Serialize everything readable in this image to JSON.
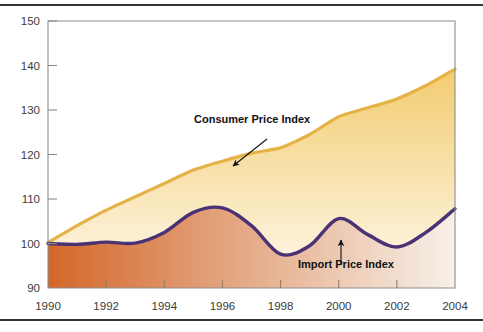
{
  "figure": {
    "name": "price-index-area-chart",
    "background_color": "#ffffff",
    "rule_color": "#333436"
  },
  "chart_data": {
    "type": "area",
    "title": "",
    "subtitle": "",
    "xlabel": "",
    "ylabel": "",
    "xlim": [
      1990,
      2004
    ],
    "ylim": [
      90,
      150
    ],
    "grid": false,
    "legend_position": "inline-annotations",
    "xticks": [
      1990,
      1992,
      1994,
      1996,
      1998,
      2000,
      2002,
      2004
    ],
    "xticklabels": [
      "1990",
      "1992",
      "1994",
      "1996",
      "1998",
      "2000",
      "2002",
      "2004"
    ],
    "yticks": [
      90,
      100,
      110,
      120,
      130,
      140,
      150
    ],
    "yticklabels": [
      "90",
      "100",
      "110",
      "120",
      "130",
      "140",
      "150"
    ],
    "x": [
      1990,
      1991,
      1992,
      1993,
      1994,
      1995,
      1996,
      1997,
      1998,
      1999,
      2000,
      2001,
      2002,
      2003,
      2004
    ],
    "series": [
      {
        "name": "Consumer Price Index",
        "line_color": "#e5b247",
        "fill_top_color": "#f2cc70",
        "fill_bottom_color": "#fdf3dc",
        "values": [
          100.2,
          104.0,
          107.5,
          110.5,
          113.5,
          116.5,
          118.5,
          120.3,
          121.5,
          124.5,
          128.5,
          130.5,
          132.5,
          135.5,
          139.2
        ]
      },
      {
        "name": "Import Price Index",
        "line_color": "#4b3275",
        "fill_left_color": "#d4672a",
        "fill_right_color": "#f7f1ea",
        "values": [
          100.0,
          99.8,
          100.3,
          100.1,
          102.5,
          107.0,
          108.0,
          104.0,
          97.6,
          99.5,
          105.6,
          102.0,
          99.2,
          102.5,
          107.8
        ]
      }
    ],
    "annotations": [
      {
        "text": "Consumer Price Index",
        "label_x": 194,
        "label_y": 123,
        "arrow_from_x": 267,
        "arrow_from_y": 131,
        "arrow_to_x": 233,
        "arrow_to_y": 158,
        "direction": "down-left"
      },
      {
        "text": "Import Price Index",
        "label_x": 298,
        "label_y": 268,
        "arrow_from_x": 341,
        "arrow_from_y": 257,
        "arrow_to_x": 341,
        "arrow_to_y": 232,
        "direction": "up"
      }
    ]
  }
}
